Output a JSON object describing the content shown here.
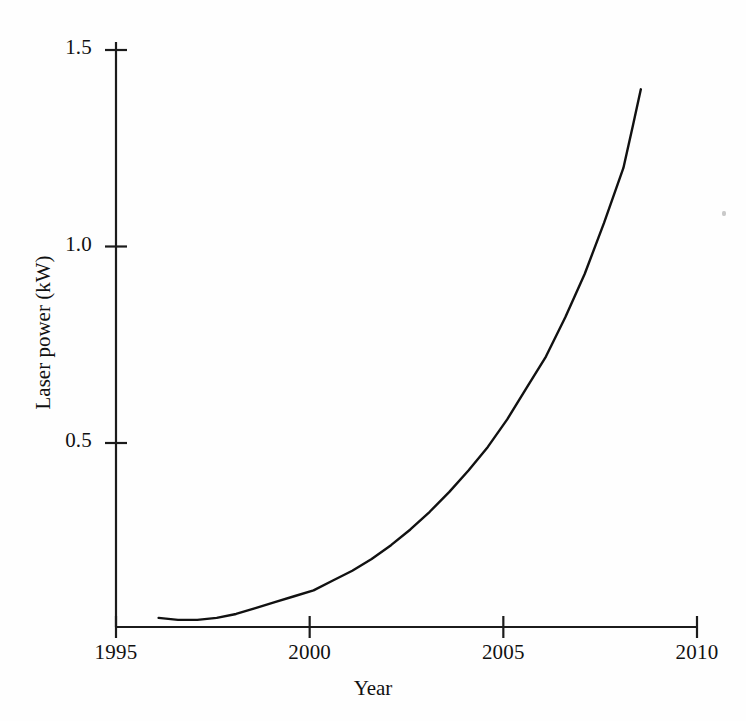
{
  "chart_data": {
    "type": "line",
    "title": "",
    "subtitle": "",
    "xlabel": "Year",
    "ylabel": "Laser power (kW)",
    "xlim": [
      1995,
      2010
    ],
    "ylim": [
      0.0,
      1.55
    ],
    "grid": false,
    "legend": null,
    "xticks": [
      1995,
      2000,
      2005,
      2010
    ],
    "xtick_labels": [
      "1995",
      "2000",
      "2005",
      "2010"
    ],
    "yticks": [
      0.5,
      1.0,
      1.5
    ],
    "ytick_labels": [
      "0.5",
      "1.0",
      "1.5"
    ],
    "series": [
      {
        "name": "Laser power",
        "color": "#111111",
        "line_width": 2.4,
        "x": [
          1996.1,
          1996.6,
          1997.1,
          1997.6,
          1998.1,
          1998.6,
          1999.1,
          1999.6,
          2000.1,
          2000.6,
          2001.1,
          2001.6,
          2002.1,
          2002.6,
          2003.1,
          2003.6,
          2004.1,
          2004.6,
          2005.1,
          2005.6,
          2006.1,
          2006.6,
          2007.1,
          2007.6,
          2008.1,
          2008.35,
          2008.55
        ],
        "y": [
          0.055,
          0.05,
          0.05,
          0.055,
          0.065,
          0.08,
          0.095,
          0.11,
          0.125,
          0.15,
          0.175,
          0.205,
          0.24,
          0.28,
          0.325,
          0.375,
          0.43,
          0.49,
          0.56,
          0.64,
          0.72,
          0.82,
          0.93,
          1.06,
          1.2,
          1.31,
          1.4
        ]
      }
    ],
    "annotations": []
  },
  "axes": {
    "x_axis_name": "x-axis",
    "y_axis_name": "y-axis"
  }
}
